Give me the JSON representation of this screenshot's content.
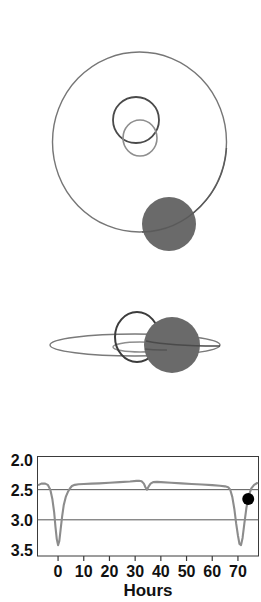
{
  "figure": {
    "title": "",
    "panels": [
      {
        "name": "face-on-orbit-view",
        "label": "",
        "elements": [
          {
            "name": "outer-orbit-ellipse",
            "cx": 139.5,
            "cy": 142,
            "rx": 87,
            "ry": 90,
            "stroke": "#767676",
            "fill": "none"
          },
          {
            "name": "inner-orbit-ellipse-upper",
            "cx": 136,
            "cy": 120,
            "rx": 23,
            "ry": 23,
            "stroke": "#4a4a4a",
            "fill": "none"
          },
          {
            "name": "inner-orbit-ellipse-lower",
            "cx": 140,
            "cy": 138,
            "rx": 17,
            "ry": 18,
            "stroke": "#8e8e8e",
            "fill": "none"
          },
          {
            "name": "primary-body-disk",
            "cx": 169,
            "cy": 224,
            "r": 27,
            "fill": "#6a6a6a"
          }
        ]
      },
      {
        "name": "edge-on-orbit-view",
        "label": "",
        "elements": [
          {
            "name": "outer-orbit-ellipse-edge",
            "cx": 135,
            "cy": 345,
            "rx": 85,
            "ry": 11,
            "stroke": "#767676",
            "fill": "none"
          },
          {
            "name": "inner-orbit-ellipse-edge",
            "cx": 140,
            "cy": 347,
            "rx": 27,
            "ry": 5,
            "stroke": "#8e8e8e",
            "fill": "none"
          },
          {
            "name": "companion-outline-circle",
            "cx": 137,
            "cy": 337,
            "rx": 22,
            "ry": 25,
            "stroke": "#3c3c3c",
            "fill": "none"
          },
          {
            "name": "primary-body-disk-edge",
            "cx": 172,
            "cy": 345,
            "r": 28,
            "fill": "#6a6a6a"
          }
        ]
      }
    ]
  },
  "chart_data": {
    "type": "line",
    "title": "",
    "xlabel": "Hours",
    "ylabel": "",
    "xlim": [
      -8,
      78
    ],
    "ylim": [
      3.6,
      1.95
    ],
    "y_inverted": true,
    "grid": true,
    "gridlines_y": [
      2.5,
      3.0
    ],
    "legend": "none",
    "xticks": [
      0,
      10,
      20,
      30,
      40,
      50,
      60,
      70
    ],
    "xticklabels": [
      "0",
      "10",
      "20",
      "30",
      "40",
      "50",
      "60",
      "70"
    ],
    "yticks": [
      2.0,
      2.5,
      3.0,
      3.5
    ],
    "yticklabels": [
      "2.0",
      "2.5",
      "3.0",
      "3.5"
    ],
    "series": [
      {
        "name": "light-curve",
        "color": "#8c8c8c",
        "x": [
          -7.5,
          -6.5,
          -5.0,
          -4.0,
          -3.0,
          -2.2,
          -1.5,
          -1.0,
          -0.5,
          0.0,
          0.5,
          1.0,
          1.6,
          2.2,
          3.0,
          3.8,
          4.6,
          5.4,
          6.5,
          8.0,
          10.0,
          13.0,
          16.0,
          20.0,
          24.0,
          28.0,
          30.5,
          31.5,
          32.5,
          33.4,
          34.0,
          34.6,
          35.2,
          36.0,
          37.0,
          38.5,
          40.0,
          44.0,
          48.0,
          52.0,
          56.0,
          60.0,
          63.0,
          65.0,
          66.2,
          67.0,
          67.8,
          68.6,
          69.3,
          70.0,
          70.6,
          71.2,
          71.8,
          72.5,
          73.3,
          74.2,
          75.2,
          76.3,
          77.5
        ],
        "y": [
          2.42,
          2.4,
          2.4,
          2.42,
          2.5,
          2.66,
          2.88,
          3.12,
          3.32,
          3.42,
          3.35,
          3.16,
          2.94,
          2.76,
          2.62,
          2.54,
          2.48,
          2.44,
          2.42,
          2.41,
          2.405,
          2.4,
          2.395,
          2.385,
          2.375,
          2.365,
          2.355,
          2.352,
          2.36,
          2.4,
          2.46,
          2.5,
          2.45,
          2.4,
          2.375,
          2.37,
          2.375,
          2.385,
          2.395,
          2.405,
          2.415,
          2.425,
          2.435,
          2.445,
          2.46,
          2.5,
          2.62,
          2.82,
          3.06,
          3.26,
          3.4,
          3.42,
          3.3,
          3.06,
          2.8,
          2.6,
          2.48,
          2.42,
          2.39
        ]
      }
    ],
    "markers": [
      {
        "name": "observation-point",
        "x": 74.0,
        "y": 2.655,
        "color": "#000000",
        "size": 6
      }
    ]
  }
}
